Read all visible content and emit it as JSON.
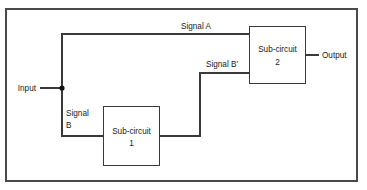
{
  "diagram": {
    "background_color": "#ffffff",
    "line_color": "#3a3a3a",
    "frame_color": "#4a4a4a",
    "text_color": "#1a1a1a",
    "frame": {
      "x": 5,
      "y": 8,
      "width": 353,
      "height": 174
    },
    "labels": {
      "input": "Input",
      "output": "Output",
      "signal_a": "Signal A",
      "signal_b_line1": "Signal",
      "signal_b_line2": "B",
      "signal_b_prime": "Signal B'"
    },
    "blocks": [
      {
        "id": "sub-circuit-1",
        "name_line1": "Sub-circuit",
        "name_line2": "1",
        "x": 103,
        "y": 106,
        "width": 57,
        "height": 60
      },
      {
        "id": "sub-circuit-2",
        "name_line1": "Sub-circuit",
        "name_line2": "2",
        "x": 249,
        "y": 26,
        "width": 57,
        "height": 58
      }
    ],
    "junction": {
      "x": 62,
      "y": 88
    },
    "wires": [
      {
        "id": "input-wire",
        "path": "M 40 88 L 62 88"
      },
      {
        "id": "signal-a-wire",
        "path": "M 62 88 L 62 34 L 249 34"
      },
      {
        "id": "signal-b-wire",
        "path": "M 62 88 L 62 136 L 103 136"
      },
      {
        "id": "signal-b-prime-wire",
        "path": "M 160 136 L 200 136 L 200 73 L 249 73"
      },
      {
        "id": "output-wire",
        "path": "M 306 55 L 319 55"
      }
    ]
  }
}
